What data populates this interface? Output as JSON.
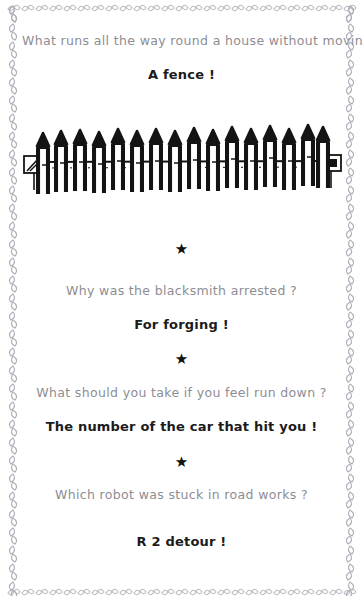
{
  "page": {
    "background_color": "#ffffff",
    "question_color": "#8d8d94",
    "answer_color": "#1b1b1b",
    "border_color": "#b4b4bc"
  },
  "border": {
    "style": "leaf-scroll-chain",
    "description": "decorative scrolled leaf chain framing all four page edges"
  },
  "illustration": {
    "name": "picket-fence",
    "caption": "hand-drawn picket fence with pointed pickets, a horizontal rail and square end posts",
    "picket_count": 16
  },
  "separator": {
    "glyph": "★",
    "name": "star-separator"
  },
  "jokes": [
    {
      "question": "What runs all the way round a house without moving ?",
      "answer": "A fence !"
    },
    {
      "question": "Why was the blacksmith arrested ?",
      "answer": "For forging !"
    },
    {
      "question": "What should you take if you feel run down ?",
      "answer": "The number of the car that hit you !"
    },
    {
      "question": "Which robot was stuck in road works ?",
      "answer": "R 2 detour !"
    }
  ]
}
